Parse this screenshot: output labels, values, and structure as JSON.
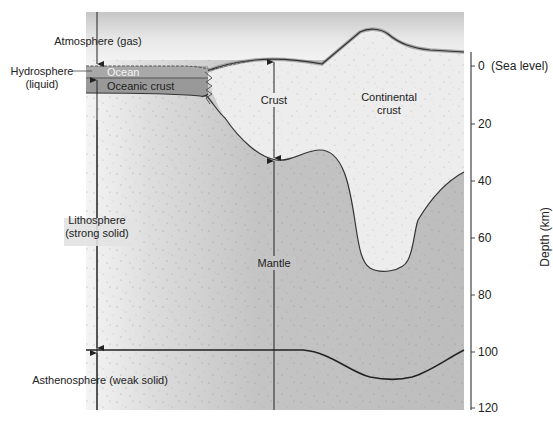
{
  "diagram": {
    "type": "cross-section",
    "labels": {
      "atmosphere": "Atmosphere (gas)",
      "hydrosphere_line1": "Hydrosphere",
      "hydrosphere_line2": "(liquid)",
      "ocean": "Ocean",
      "oceanic_crust": "Oceanic crust",
      "crust": "Crust",
      "continental_line1": "Continental",
      "continental_line2": "crust",
      "lithosphere_line1": "Lithosphere",
      "lithosphere_line2": "(strong solid)",
      "mantle": "Mantle",
      "asthenosphere": "Asthenosphere (weak solid)"
    },
    "axis": {
      "title": "Depth (km)",
      "ticks": [
        {
          "value": 0,
          "label": "0",
          "suffix": "(Sea level)"
        },
        {
          "value": 20,
          "label": "20"
        },
        {
          "value": 40,
          "label": "40"
        },
        {
          "value": 60,
          "label": "60"
        },
        {
          "value": 80,
          "label": "80"
        },
        {
          "value": 100,
          "label": "100"
        },
        {
          "value": 120,
          "label": "120"
        }
      ],
      "range": [
        0,
        120
      ]
    },
    "colors": {
      "sky_top": "#c9c9c9",
      "sky_bottom": "#f7f7f7",
      "ocean": "#a9a9a9",
      "oceanic_crust": "#9a9a9a",
      "continental_crust": "#ededed",
      "mantle": "#c2c2c2",
      "mantle_light": "#f2f2f2",
      "line": "#333333"
    }
  }
}
